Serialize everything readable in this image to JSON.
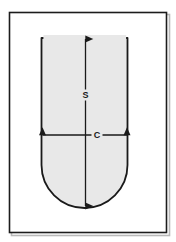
{
  "figure": {
    "background_color": "#ffffff",
    "frame": {
      "name": "figure-border",
      "x": 9,
      "y": 12,
      "width": 158,
      "height": 221,
      "stroke_color": "#1c1c1c",
      "stroke_width": 1.6,
      "fill_color": "#ffffff",
      "shadow_color": "#b9b9b9"
    },
    "shape": {
      "name": "u-profile",
      "fill_color": "#e8e8e8",
      "stroke_color": "#1a1a1a",
      "stroke_width": 1.8,
      "left": 41,
      "right": 128,
      "top": 38,
      "bottom": 208,
      "corner_radius": 43,
      "description": "open flat top, straight parallel sides, semicircular rounded bottom"
    },
    "dimensions": [
      {
        "id": "s",
        "label": "S",
        "orientation": "vertical",
        "name": "dimension-arrow-s",
        "color": "#1a1a1a",
        "line_width": 1.3,
        "x": 85.5,
        "start": 39,
        "end": 206,
        "label_x": 85.5,
        "label_y": 95,
        "arrowheads": "both"
      },
      {
        "id": "c",
        "label": "C",
        "orientation": "horizontal",
        "name": "dimension-arrow-c",
        "color": "#1a1a1a",
        "line_width": 1.3,
        "y": 135,
        "start": 42,
        "end": 127,
        "label_x": 97,
        "label_y": 135,
        "arrowheads": "both"
      }
    ]
  }
}
